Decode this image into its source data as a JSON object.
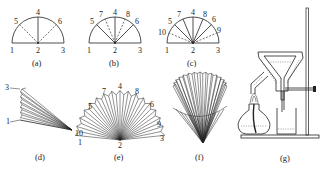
{
  "figure": {
    "panels": [
      {
        "id": "a",
        "caption": "(a)",
        "point_labels": [
          "1",
          "2",
          "3",
          "4",
          "5",
          "6"
        ]
      },
      {
        "id": "b",
        "caption": "(b)",
        "point_labels": [
          "1",
          "2",
          "3",
          "4",
          "5",
          "6",
          "7",
          "8"
        ]
      },
      {
        "id": "c",
        "caption": "(c)",
        "point_labels": [
          "1",
          "2",
          "3",
          "4",
          "5",
          "6",
          "7",
          "8",
          "9",
          "10"
        ]
      },
      {
        "id": "d",
        "caption": "(d)",
        "point_labels": [
          "1",
          "3"
        ]
      },
      {
        "id": "e",
        "caption": "(e)",
        "point_labels": [
          "1",
          "2",
          "3",
          "4",
          "5",
          "6",
          "7",
          "8",
          "9",
          "10"
        ]
      },
      {
        "id": "f",
        "caption": "(f)",
        "point_labels": []
      },
      {
        "id": "g",
        "caption": "(g)",
        "point_labels": []
      }
    ]
  }
}
